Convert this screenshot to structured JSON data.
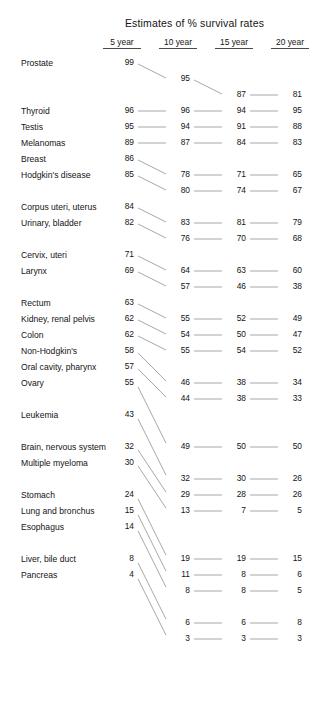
{
  "title": "Estimates of % survival rates",
  "columns": [
    {
      "label": "5 year",
      "key": "y5",
      "x": 134
    },
    {
      "label": "10 year",
      "key": "y10",
      "x": 190
    },
    {
      "label": "15 year",
      "key": "y15",
      "x": 246
    },
    {
      "label": "20 year",
      "key": "y20",
      "x": 302
    }
  ],
  "style": {
    "line_color": "#5d5d5d",
    "text_color": "#141414",
    "background": "#ffffff"
  },
  "chart_data": {
    "type": "line",
    "title": "Estimates of % survival rates",
    "xlabel": "",
    "ylabel": "",
    "x": [
      "5 year",
      "10 year",
      "15 year",
      "20 year"
    ],
    "legend_position": "left-labels",
    "grid": false,
    "series": [
      {
        "name": "Prostate",
        "values": [
          99,
          95,
          87,
          81
        ]
      },
      {
        "name": "Thyroid",
        "values": [
          96,
          96,
          94,
          95
        ]
      },
      {
        "name": "Testis",
        "values": [
          95,
          94,
          91,
          88
        ]
      },
      {
        "name": "Melanomas",
        "values": [
          89,
          87,
          84,
          83
        ]
      },
      {
        "name": "Breast",
        "values": [
          86,
          78,
          71,
          65
        ]
      },
      {
        "name": "Hodgkin's disease",
        "values": [
          85,
          80,
          74,
          67
        ]
      },
      {
        "name": "Corpus uteri, uterus",
        "values": [
          84,
          83,
          81,
          79
        ]
      },
      {
        "name": "Urinary, bladder",
        "values": [
          82,
          76,
          70,
          68
        ]
      },
      {
        "name": "Cervix, uteri",
        "values": [
          71,
          64,
          63,
          60
        ]
      },
      {
        "name": "Larynx",
        "values": [
          69,
          57,
          46,
          38
        ]
      },
      {
        "name": "Rectum",
        "values": [
          63,
          55,
          52,
          49
        ]
      },
      {
        "name": "Kidney, renal pelvis",
        "values": [
          62,
          54,
          50,
          47
        ]
      },
      {
        "name": "Colon",
        "values": [
          62,
          55,
          54,
          52
        ]
      },
      {
        "name": "Non-Hodgkin's",
        "values": [
          58,
          46,
          38,
          34
        ]
      },
      {
        "name": "Oral cavity, pharynx",
        "values": [
          57,
          44,
          38,
          33
        ]
      },
      {
        "name": "Ovary",
        "values": [
          55,
          49,
          50,
          50
        ]
      },
      {
        "name": "Leukemia",
        "values": [
          43,
          32,
          30,
          26
        ]
      },
      {
        "name": "Brain, nervous system",
        "values": [
          32,
          29,
          28,
          26
        ]
      },
      {
        "name": "Multiple myeloma",
        "values": [
          30,
          13,
          7,
          5
        ]
      },
      {
        "name": "Stomach",
        "values": [
          24,
          19,
          19,
          15
        ]
      },
      {
        "name": "Lung and bronchus",
        "values": [
          15,
          11,
          8,
          6
        ]
      },
      {
        "name": "Esophagus",
        "values": [
          14,
          8,
          8,
          5
        ]
      },
      {
        "name": "Liver, bile duct",
        "values": [
          8,
          6,
          6,
          8
        ]
      },
      {
        "name": "Pancreas",
        "values": [
          4,
          3,
          3,
          3
        ]
      }
    ],
    "row_slots": {
      "y5": [
        0,
        3,
        4,
        5,
        6,
        7,
        9,
        10,
        12,
        13,
        15,
        16,
        17,
        18,
        19,
        20,
        22,
        24,
        25,
        27,
        28,
        29,
        31,
        32
      ],
      "y10": [
        1,
        3,
        4,
        5,
        7,
        8,
        10,
        11,
        13,
        14,
        16,
        17,
        18,
        20,
        21,
        24,
        26,
        27,
        28,
        31,
        32,
        33,
        35,
        36
      ],
      "y15": [
        2,
        3,
        4,
        5,
        7,
        8,
        10,
        11,
        13,
        14,
        16,
        17,
        18,
        20,
        21,
        24,
        26,
        27,
        28,
        31,
        32,
        33,
        35,
        36
      ],
      "y20": [
        2,
        3,
        4,
        5,
        7,
        8,
        10,
        11,
        13,
        14,
        16,
        17,
        18,
        20,
        21,
        24,
        26,
        27,
        28,
        31,
        32,
        33,
        35,
        36
      ]
    }
  }
}
